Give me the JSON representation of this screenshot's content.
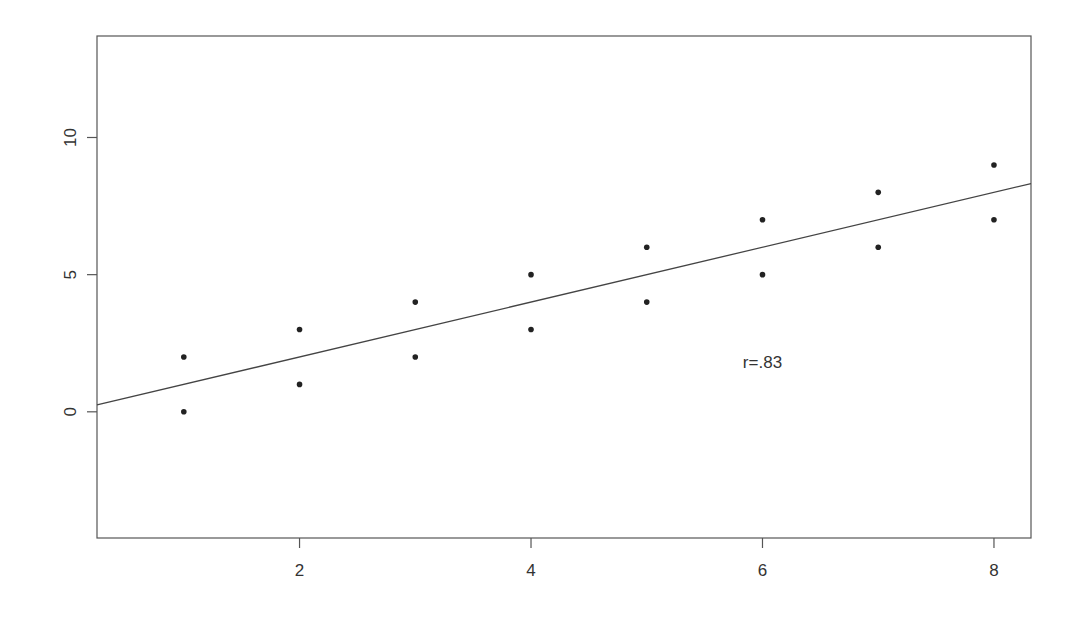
{
  "chart_data": {
    "type": "scatter",
    "title": "",
    "xlabel": "",
    "ylabel": "",
    "xlim": [
      0.25,
      8.32
    ],
    "ylim": [
      -4.6,
      13.7
    ],
    "grid": false,
    "legend": null,
    "x_ticks": [
      2,
      4,
      6,
      8
    ],
    "y_ticks": [
      0,
      5,
      10
    ],
    "points": [
      {
        "x": 1,
        "y": 0
      },
      {
        "x": 1,
        "y": 2
      },
      {
        "x": 2,
        "y": 1
      },
      {
        "x": 2,
        "y": 3
      },
      {
        "x": 3,
        "y": 2
      },
      {
        "x": 3,
        "y": 4
      },
      {
        "x": 4,
        "y": 3
      },
      {
        "x": 4,
        "y": 5
      },
      {
        "x": 5,
        "y": 4
      },
      {
        "x": 5,
        "y": 6
      },
      {
        "x": 6,
        "y": 5
      },
      {
        "x": 6,
        "y": 7
      },
      {
        "x": 7,
        "y": 6
      },
      {
        "x": 7,
        "y": 8
      },
      {
        "x": 8,
        "y": 7
      },
      {
        "x": 8,
        "y": 9
      }
    ],
    "fit_line": {
      "slope": 1.0,
      "intercept": 0.0
    },
    "annotations": [
      {
        "text": "r=.83",
        "x": 6,
        "y": 1.8
      }
    ]
  },
  "colors": {
    "axis": "#555555",
    "point": "#222222",
    "line": "#444444",
    "text": "#333333"
  }
}
